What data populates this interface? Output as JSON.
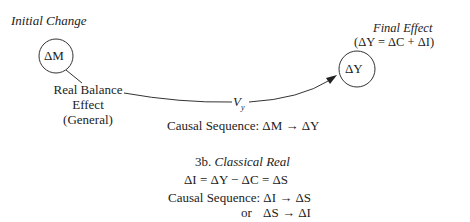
{
  "diagram": {
    "initial_change": {
      "title": "Initial Change",
      "node": "ΔM"
    },
    "mechanism": {
      "line1": "Real Balance",
      "line2": "Effect",
      "line3": "(General)",
      "velocity_label_main": "V",
      "velocity_label_sub": "y"
    },
    "final_effect": {
      "title": "Final Effect",
      "equation": "(ΔY = ΔC + ΔI)",
      "node": "ΔY"
    },
    "causal_sequence": {
      "label": "Causal Sequence:",
      "sequence": "ΔM → ΔY"
    },
    "section_3b": {
      "number": "3b.",
      "title": "Classical Real",
      "equation": "ΔI = ΔY − ΔC = ΔS",
      "causal_label": "Causal Sequence:",
      "sequence1": "ΔI → ΔS",
      "or_label": "or",
      "sequence2": "ΔS → ΔI"
    }
  }
}
